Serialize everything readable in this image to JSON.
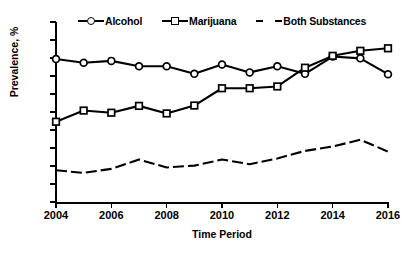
{
  "chart_data": {
    "type": "line",
    "title": "",
    "xlabel": "Time Period",
    "ylabel": "Prevalence, %",
    "xlim": [
      2004,
      2016
    ],
    "ylim": [
      0,
      50
    ],
    "ytick_step": 5,
    "xtick_step": 2,
    "grid": false,
    "legend_position": "top",
    "x": [
      2004,
      2005,
      2006,
      2007,
      2008,
      2009,
      2010,
      2011,
      2012,
      2013,
      2014,
      2015,
      2016
    ],
    "xticks": [
      "2004",
      "2006",
      "2008",
      "2010",
      "2012",
      "2014",
      "2016"
    ],
    "yticks": [
      "0",
      "5",
      "10",
      "15",
      "20",
      "25",
      "30",
      "35",
      "40",
      "45",
      "50"
    ],
    "series": [
      {
        "name": "Alcohol",
        "marker": "circle",
        "line": "solid",
        "color": "#000000",
        "values": [
          39.7,
          38.7,
          39.2,
          37.7,
          37.7,
          35.6,
          38.2,
          36.0,
          37.7,
          35.6,
          40.4,
          39.9,
          35.5
        ]
      },
      {
        "name": "Marijuana",
        "marker": "square",
        "line": "solid",
        "color": "#000000",
        "values": [
          22.3,
          25.4,
          24.8,
          26.7,
          24.6,
          26.8,
          31.6,
          31.6,
          32.1,
          37.3,
          40.6,
          42.0,
          42.7
        ]
      },
      {
        "name": "Both Substances",
        "marker": "none",
        "line": "dashed",
        "color": "#000000",
        "values": [
          8.8,
          8.1,
          9.2,
          11.8,
          9.6,
          10.1,
          11.8,
          10.5,
          12.1,
          14.2,
          15.4,
          17.3,
          14.0
        ]
      }
    ]
  },
  "legend": {
    "items": [
      {
        "label": "Alcohol"
      },
      {
        "label": "Marijuana"
      },
      {
        "label": "Both Substances"
      }
    ]
  }
}
